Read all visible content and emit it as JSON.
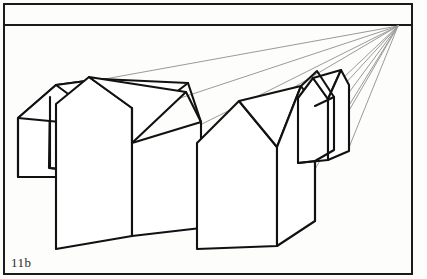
{
  "figure": {
    "caption": "11b",
    "type": "line-drawing",
    "colors": {
      "frame": "#1a1a1a",
      "horizon": "#1a1a1a",
      "object_outline": "#111111",
      "construction_line": "#9a9a9a",
      "paper": "#fdfdfb"
    },
    "frame": {
      "name": "figure-border",
      "x": 3,
      "y": 3,
      "width": 410,
      "height": 272,
      "stroke_width": 2
    },
    "horizon": {
      "name": "horizon-line",
      "y": 25,
      "x_start": 3,
      "x_end": 413,
      "stroke_width": 2
    },
    "vanishing_point": {
      "name": "vanishing-point",
      "x": 398,
      "y": 25,
      "label": "VP"
    },
    "construction_lines": [
      {
        "from_x": 65,
        "from_y": 85,
        "to_x": 398,
        "to_y": 25
      },
      {
        "from_x": 109,
        "from_y": 120,
        "to_x": 398,
        "to_y": 25
      },
      {
        "from_x": 178,
        "from_y": 137,
        "to_x": 398,
        "to_y": 25
      },
      {
        "from_x": 213,
        "from_y": 200,
        "to_x": 398,
        "to_y": 25
      },
      {
        "from_x": 273,
        "from_y": 236,
        "to_x": 398,
        "to_y": 25
      },
      {
        "from_x": 314,
        "from_y": 160,
        "to_x": 398,
        "to_y": 25
      },
      {
        "from_x": 333,
        "from_y": 96,
        "to_x": 398,
        "to_y": 25
      }
    ],
    "objects": [
      {
        "name": "house-back-left",
        "description": "Rear house at far left, gable end facing viewer-left, long ridge receding to the vanishing point",
        "outline": "M 17,119 L 17,176 L 58,176 L 58,169 L 48,168 L 49,97 L 55,85 L 100,80 L 108,85 L 112,127 L 79,160 L 63,159 Z",
        "polylines": [
          "M 17,119 L 55,85 L 100,80 L 112,127",
          "M 17,119 L 17,176 L 58,177",
          "M 55,85 L 48,167",
          "M 48,167 L 58,177",
          "M 100,80 L 186,83",
          "M 112,127 L 124,131",
          "M 186,83 L 200,123"
        ]
      },
      {
        "name": "house-front-left",
        "description": "Nearest large house, gable end to the left, side wall and roof plane receding right toward vanishing point",
        "polylines": [
          "M 55,104 L 88,77 L 131,101 L 131,108 L 131,235 L 55,248 L 55,104",
          "M 88,77 L 185,93 L 131,143",
          "M 185,93 L 200,123 L 200,227 L 131,235",
          "M 131,143 L 131,235",
          "M 55,104 L 88,77"
        ]
      },
      {
        "name": "house-middle",
        "description": "Second large house set back and to the right, gable end facing left, ridge to the vanishing point",
        "polylines": [
          "M 196,143 L 238,101 L 276,140 L 276,147 L 276,245 L 196,248 L 196,143",
          "M 238,101 L 300,86 L 276,147",
          "M 300,86 L 313,105 L 313,220 L 276,245",
          "M 196,143 L 196,248"
        ]
      },
      {
        "name": "house-far-small",
        "description": "Small distant house near the vanishing point, narrow gable with short receding roof",
        "polylines": [
          "M 297,98 L 312,78 L 327,94 L 327,99 L 327,160 L 297,162 L 297,98",
          "M 312,78 L 340,70 L 327,99",
          "M 340,70 L 348,84 L 348,150 L 327,160",
          "M 297,162 L 297,98"
        ]
      },
      {
        "name": "roof-ridge-far",
        "description": "Long continuous ridge/eave edges converging at the vanishing point",
        "polylines": [
          "M 300,86 L 316,72 L 333,96",
          "M 313,105 L 333,96"
        ]
      }
    ]
  }
}
